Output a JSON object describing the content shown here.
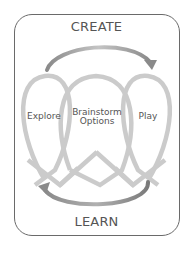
{
  "diagram": {
    "top_label": "CREATE",
    "bottom_label": "LEARN",
    "loops": [
      {
        "label": "Explore"
      },
      {
        "label_line1": "Brainstorm",
        "label_line2": "Options"
      },
      {
        "label": "Play"
      }
    ],
    "colors": {
      "frame": "#6a6a6a",
      "loop": "#c8c8c8",
      "arrow": "#9a9a9a",
      "text": "#555555"
    }
  }
}
